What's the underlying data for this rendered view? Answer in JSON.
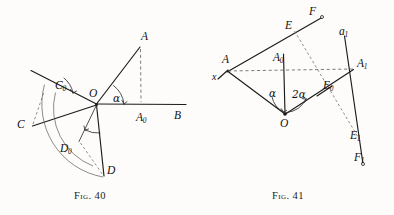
{
  "page": {
    "background_color": "#fdfcfa",
    "ink_color": "#1b1b1b",
    "width": 394,
    "height": 215
  },
  "figures": [
    {
      "id": "fig-40",
      "caption_prefix": "Fig.",
      "caption_number": "40",
      "caption_full": "Fig. 40",
      "description": "Angle alpha at vertex O between ray OB and ray OA, with rotated positions C0, D0 and arcs sweeping to C and D.",
      "labels": [
        {
          "name": "point-label-A",
          "text": "A",
          "sub": "",
          "x": 141,
          "y": 31
        },
        {
          "name": "point-label-A0",
          "text": "A",
          "sub": "0",
          "x": 136,
          "y": 112
        },
        {
          "name": "point-label-B",
          "text": "B",
          "sub": "",
          "x": 174,
          "y": 110
        },
        {
          "name": "point-label-O",
          "text": "O",
          "sub": "",
          "x": 89,
          "y": 88
        },
        {
          "name": "angle-label-alpha",
          "text": "α",
          "sub": "",
          "x": 113,
          "y": 93
        },
        {
          "name": "point-label-C",
          "text": "C",
          "sub": "",
          "x": 17,
          "y": 119
        },
        {
          "name": "point-label-C0",
          "text": "C",
          "sub": "0",
          "x": 55,
          "y": 80
        },
        {
          "name": "point-label-D",
          "text": "D",
          "sub": "",
          "x": 107,
          "y": 165
        },
        {
          "name": "point-label-D0",
          "text": "D",
          "sub": "0",
          "x": 60,
          "y": 143
        }
      ]
    },
    {
      "id": "fig-41",
      "caption_prefix": "Fig.",
      "caption_number": "41",
      "caption_full": "Fig. 41",
      "description": "Reflection construction: mirror x through A, rays AE and AF, centre O with angles alpha and 2alpha, image points A1, E0, E1, F1 and axis a1.",
      "labels": [
        {
          "name": "point-label-A",
          "text": "A",
          "sub": "",
          "x": 25,
          "y": 54
        },
        {
          "name": "point-label-A0",
          "text": "A",
          "sub": "0",
          "x": 76,
          "y": 52
        },
        {
          "name": "point-label-A1",
          "text": "A",
          "sub": "1",
          "x": 160,
          "y": 58
        },
        {
          "name": "axis-label-x",
          "text": "x",
          "sub": "",
          "x": 15,
          "y": 68
        },
        {
          "name": "point-label-E",
          "text": "E",
          "sub": "",
          "x": 88,
          "y": 20
        },
        {
          "name": "point-label-F",
          "text": "F",
          "sub": "",
          "x": 112,
          "y": 8
        },
        {
          "name": "axis-label-a1",
          "text": "a",
          "sub": "1",
          "x": 142,
          "y": 28
        },
        {
          "name": "point-label-E0",
          "text": "E",
          "sub": "0",
          "x": 126,
          "y": 83
        },
        {
          "name": "point-label-E1",
          "text": "E",
          "sub": "1",
          "x": 153,
          "y": 132
        },
        {
          "name": "point-label-F1",
          "text": "F",
          "sub": "1",
          "x": 157,
          "y": 155
        },
        {
          "name": "point-label-O",
          "text": "O",
          "sub": "",
          "x": 85,
          "y": 112
        },
        {
          "name": "angle-label-alpha",
          "text": "α",
          "sub": "",
          "x": 73,
          "y": 87
        },
        {
          "name": "angle-label-two-alpha",
          "text": "2α",
          "sub": "",
          "x": 95,
          "y": 88
        }
      ]
    }
  ],
  "geometry": {
    "fig40": {
      "O": [
        97,
        104
      ],
      "A": [
        140,
        47
      ],
      "A0": [
        141,
        104
      ],
      "B": [
        186,
        104
      ],
      "C": [
        32,
        126
      ],
      "C0": [
        31,
        71
      ],
      "D": [
        104,
        176
      ],
      "D0": [
        80,
        141
      ],
      "ray_top_left_end": [
        31,
        71
      ],
      "arc_outer_from_C0_to_D": "arc centred at O radius ~78",
      "arc_inner_from_C_to_D0": "arc centred at O radius ~68"
    },
    "fig41": {
      "A": [
        228,
        68
      ],
      "A0": [
        283,
        68
      ],
      "A1": [
        353,
        68
      ],
      "O": [
        285,
        113
      ],
      "E": [
        297,
        28
      ],
      "F": [
        322,
        16
      ],
      "E0": [
        337,
        88
      ],
      "E1": [
        361,
        139
      ],
      "F1": [
        363,
        163
      ],
      "a1_top": [
        344,
        35
      ],
      "x_left": [
        220,
        76
      ]
    }
  }
}
